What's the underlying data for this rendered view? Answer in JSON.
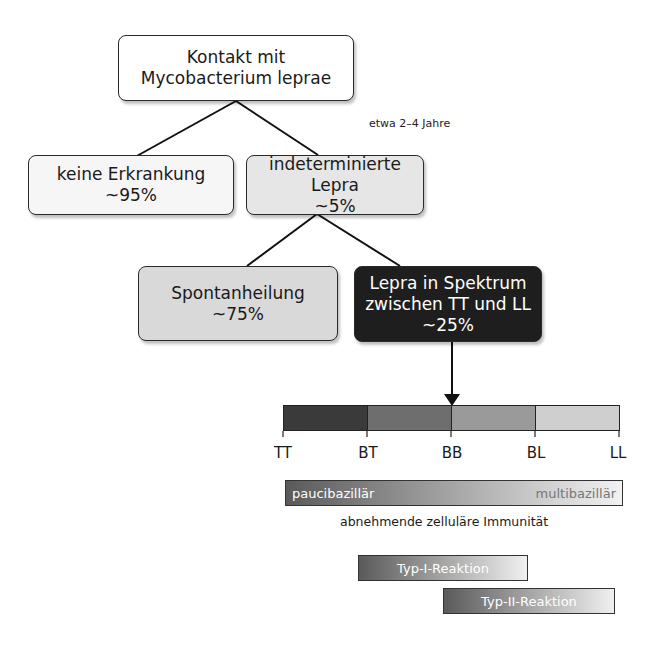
{
  "nodes": {
    "root": {
      "line1": "Kontakt mit",
      "line2": "Mycobacterium leprae"
    },
    "no_disease": {
      "line1": "keine Erkrankung",
      "line2": "~95%"
    },
    "indeterminate": {
      "line1": "indeterminierte Lepra",
      "line2": "~5%"
    },
    "spontaneous": {
      "line1": "Spontanheilung",
      "line2": "~75%"
    },
    "spectrum": {
      "line1": "Lepra in Spektrum",
      "line2": "zwischen TT und LL",
      "line3": "~25%"
    }
  },
  "edge_note": "etwa 2–4 Jahre",
  "spectrum_scale": {
    "ticks": [
      "TT",
      "BT",
      "BB",
      "BL",
      "LL"
    ],
    "segment_colors": [
      "#3a3a3a",
      "#6e6e6e",
      "#9a9a9a",
      "#cfcfcf"
    ]
  },
  "bacillary_bar": {
    "left_label": "paucibazillär",
    "right_label": "multibazillär"
  },
  "immunity_caption": "abnehmende zelluläre Immunität",
  "reactions": {
    "type1": "Typ-I-Reaktion",
    "type2": "Typ-II-Reaktion"
  }
}
